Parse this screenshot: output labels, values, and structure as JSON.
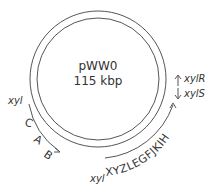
{
  "plasmid": {
    "name": "pWW0",
    "size": "115 kbp",
    "ring_color": "#555555",
    "text_color": "#333333"
  },
  "operons": {
    "lower": {
      "prefix": "xyl",
      "genes": [
        "C",
        "A",
        "B"
      ]
    },
    "meta": {
      "prefix": "xyl",
      "genes": "XYZLEGFJKIH"
    },
    "regulators": [
      {
        "label": "xylR",
        "direction": "up"
      },
      {
        "label": "xylS",
        "direction": "down"
      }
    ]
  }
}
